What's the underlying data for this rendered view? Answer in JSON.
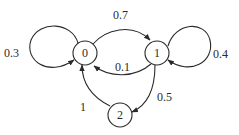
{
  "diagram": {
    "type": "markov-chain-state-diagram",
    "nodes": [
      {
        "id": "0",
        "label": "0",
        "cx": 85,
        "cy": 53,
        "r": 12
      },
      {
        "id": "1",
        "label": "1",
        "cx": 157,
        "cy": 53,
        "r": 12
      },
      {
        "id": "2",
        "label": "2",
        "cx": 120,
        "cy": 115,
        "r": 12
      }
    ],
    "edges": [
      {
        "from": "0",
        "to": "0",
        "label": "0.3",
        "kind": "self-loop",
        "path": "M 78 43 C 72 22, 40 20, 31 40 C 24 60, 48 78, 74 60",
        "label_x": 4,
        "label_y": 57
      },
      {
        "from": "0",
        "to": "1",
        "label": "0.7",
        "kind": "curve",
        "path": "M 93 44 C 105 30, 132 22, 150 40",
        "label_x": 113,
        "label_y": 19
      },
      {
        "from": "1",
        "to": "1",
        "label": "0.4",
        "kind": "self-loop",
        "path": "M 168 46 C 175 22, 205 20, 210 40 C 215 62, 190 76, 168 60",
        "label_x": 213,
        "label_y": 58
      },
      {
        "from": "1",
        "to": "0",
        "label": "0.1",
        "kind": "curve",
        "path": "M 151 64 C 135 78, 110 78, 94 66",
        "label_x": 115,
        "label_y": 71
      },
      {
        "from": "1",
        "to": "2",
        "label": "0.5",
        "kind": "curve",
        "path": "M 155 65 C 155 90, 148 105, 132 112",
        "label_x": 157,
        "label_y": 101
      },
      {
        "from": "2",
        "to": "0",
        "label": "1",
        "kind": "curve",
        "path": "M 110 106 C 90 96, 82 82, 82 65",
        "label_x": 80,
        "label_y": 111
      }
    ],
    "colors": {
      "stroke": "#2a2a2a",
      "background": "#ffffff",
      "text": "#2a2a2a"
    }
  }
}
